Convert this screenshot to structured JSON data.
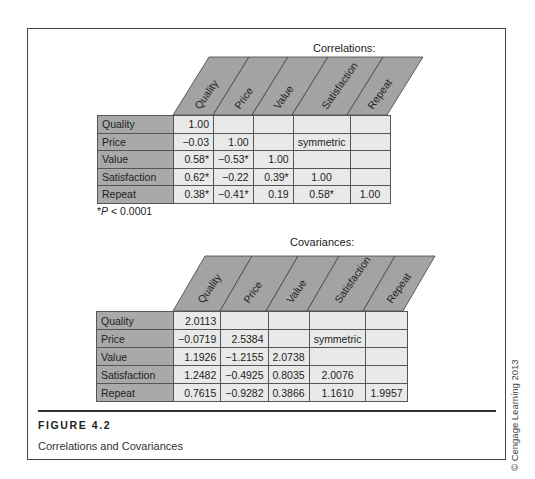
{
  "figure": {
    "label": "FIGURE 4.2",
    "caption": "Correlations and Covariances",
    "copyright": "© Cengage Learning 2013"
  },
  "correlations": {
    "title": "Correlations:",
    "columns": [
      "Quality",
      "Price",
      "Value",
      "Satisfaction",
      "Repeat"
    ],
    "rows": [
      {
        "label": "Quality",
        "cells": [
          "1.00",
          "",
          "",
          "",
          ""
        ]
      },
      {
        "label": "Price",
        "cells": [
          "−0.03",
          "1.00",
          "",
          "symmetric",
          ""
        ]
      },
      {
        "label": "Value",
        "cells": [
          "0.58*",
          "−0.53*",
          "1.00",
          "",
          ""
        ]
      },
      {
        "label": "Satisfaction",
        "cells": [
          "0.62*",
          "−0.22",
          "0.39*",
          "1.00",
          ""
        ]
      },
      {
        "label": "Repeat",
        "cells": [
          "0.38*",
          "−0.41*",
          "0.19",
          "0.58*",
          "1.00"
        ]
      }
    ],
    "footnote_prefix": "*",
    "footnote_var": "P",
    "footnote_rest": " < 0.0001"
  },
  "covariances": {
    "title": "Covariances:",
    "columns": [
      "Quality",
      "Price",
      "Value",
      "Satisfaction",
      "Repeat"
    ],
    "rows": [
      {
        "label": "Quality",
        "cells": [
          "2.0113",
          "",
          "",
          "",
          ""
        ]
      },
      {
        "label": "Price",
        "cells": [
          "−0.0719",
          "2.5384",
          "",
          "symmetric",
          ""
        ]
      },
      {
        "label": "Value",
        "cells": [
          "1.1926",
          "−1.2155",
          "2.0738",
          "",
          ""
        ]
      },
      {
        "label": "Satisfaction",
        "cells": [
          "1.2482",
          "−0.4925",
          "0.8035",
          "2.0076",
          ""
        ]
      },
      {
        "label": "Repeat",
        "cells": [
          "0.7615",
          "−0.9282",
          "0.3866",
          "1.1610",
          "1.9957"
        ]
      }
    ]
  },
  "colors": {
    "header_fill": "#a3a3a3",
    "label_fill": "#a9a9a9",
    "cell_fill": "#e9e9e9",
    "border": "#555555"
  }
}
